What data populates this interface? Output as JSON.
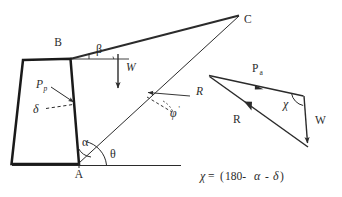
{
  "figure": {
    "background_color": "#ffffff",
    "line_color": "#2b2b2b",
    "wall_stroke_color": "#1a1a1a"
  },
  "labels": {
    "point_b": "B",
    "point_a": "A",
    "point_c": "C",
    "angle_beta": "β",
    "angle_alpha": "α",
    "angle_theta": "θ",
    "angle_delta": "δ",
    "angle_phi": "φ",
    "angle_phi_prime": "'",
    "force_w": "W",
    "force_r": "R",
    "force_pp_main": "P",
    "force_pp_sub": "p",
    "force_pa_main": "P",
    "force_pa_sub": "a",
    "triangle_w": "W",
    "triangle_r": "R",
    "triangle_chi": "χ"
  },
  "equation": {
    "lhs": "χ",
    "operator": "=",
    "open_paren": "(",
    "value": "180-",
    "term_alpha": "α",
    "minus": "-",
    "term_delta": "δ",
    "close_paren": ")",
    "full_text": "χ= (180- α - δ)"
  },
  "geometry": {
    "wall": {
      "top_left": [
        23,
        60
      ],
      "top_right": [
        71,
        59
      ],
      "bottom_right": [
        79,
        163
      ],
      "bottom_left": [
        12,
        163
      ]
    },
    "ground_line": {
      "from": [
        12,
        165
      ],
      "to": [
        181,
        165
      ]
    },
    "slope_line": {
      "from": [
        71,
        59
      ],
      "to": [
        238,
        16
      ]
    },
    "failure_plane": {
      "from": [
        79,
        163
      ],
      "to": [
        238,
        16
      ]
    },
    "beta_reference": {
      "from": [
        71,
        59
      ],
      "to": [
        128,
        59
      ]
    },
    "weight_arrow": {
      "from": [
        118,
        55
      ],
      "to": [
        118,
        92
      ]
    },
    "pp_arrow": {
      "from": [
        52,
        88
      ],
      "to": [
        76,
        104
      ]
    },
    "r_arrow": {
      "from": [
        189,
        97
      ],
      "to": [
        146,
        93
      ]
    },
    "force_triangle": {
      "apex_left": [
        209,
        76
      ],
      "corner_top_right": [
        303,
        96
      ],
      "corner_bottom": [
        307,
        146
      ]
    }
  },
  "annotations": {
    "phi_prime_display": "φ'",
    "pp_display": "Pp",
    "pa_display": "Pa"
  }
}
